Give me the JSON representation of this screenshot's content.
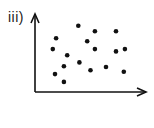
{
  "chart_data": {
    "type": "scatter",
    "title": "iii)",
    "xlabel": "",
    "ylabel": "",
    "grid": false,
    "legend": null,
    "axes": {
      "origin_px": [
        35,
        92
      ],
      "x_end_px": 146,
      "y_end_px": 14,
      "xlim": [
        0,
        10
      ],
      "ylim": [
        0,
        10
      ],
      "ticks": false
    },
    "points_px": [
      [
        78,
        26
      ],
      [
        95,
        31
      ],
      [
        116,
        31
      ],
      [
        56,
        38
      ],
      [
        87,
        41
      ],
      [
        53,
        49
      ],
      [
        95,
        49
      ],
      [
        116,
        51
      ],
      [
        125,
        49
      ],
      [
        67,
        55
      ],
      [
        79,
        61
      ],
      [
        64,
        66
      ],
      [
        91,
        70
      ],
      [
        106,
        67
      ],
      [
        55,
        74
      ],
      [
        124,
        72
      ],
      [
        64,
        82
      ]
    ],
    "x": [
      3.9,
      5.4,
      7.3,
      1.9,
      4.7,
      1.6,
      5.4,
      7.3,
      8.1,
      2.9,
      4.0,
      2.6,
      5.0,
      6.4,
      1.8,
      8.0,
      2.6
    ],
    "y": [
      8.5,
      7.8,
      7.8,
      6.9,
      6.5,
      5.5,
      5.5,
      5.2,
      5.5,
      4.7,
      3.8,
      3.3,
      2.8,
      3.2,
      2.3,
      2.6,
      1.3
    ],
    "marker_color": "#111111",
    "axis_color": "#111111"
  },
  "figure": {
    "label": "iii)"
  }
}
